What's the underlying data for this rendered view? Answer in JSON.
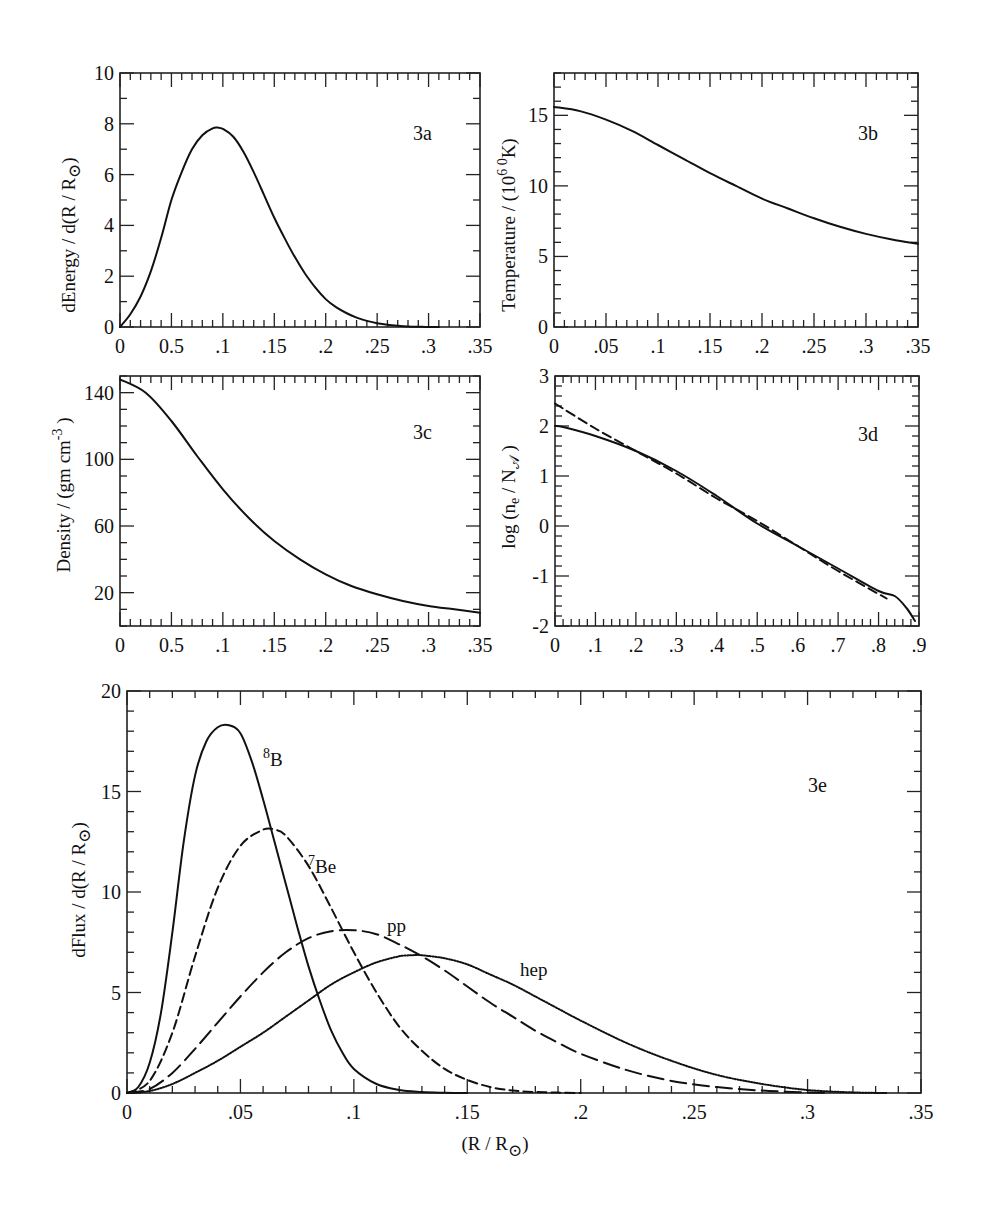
{
  "chart_data": [
    {
      "id": "3a",
      "type": "line",
      "panel_tag": "3a",
      "title": "",
      "xlabel": "",
      "ylabel": "dEnergy / d(R / R⊙)",
      "xlim": [
        0,
        0.35
      ],
      "ylim": [
        0,
        10
      ],
      "x_tick_labels": [
        "0",
        "0.5",
        ".1",
        ".15",
        ".2",
        ".25",
        ".3",
        ".35"
      ],
      "y_tick_labels": [
        "0",
        "2",
        "4",
        "6",
        "8",
        "10"
      ],
      "series": [
        {
          "name": "energy generation",
          "style": "solid",
          "x": [
            0,
            0.01,
            0.02,
            0.03,
            0.04,
            0.05,
            0.06,
            0.07,
            0.08,
            0.09,
            0.095,
            0.1,
            0.11,
            0.12,
            0.13,
            0.14,
            0.15,
            0.16,
            0.17,
            0.18,
            0.19,
            0.2,
            0.21,
            0.22,
            0.23,
            0.24,
            0.25,
            0.26,
            0.27,
            0.28,
            0.29,
            0.3,
            0.31
          ],
          "y": [
            0,
            0.5,
            1.2,
            2.2,
            3.5,
            5.0,
            6.1,
            7.0,
            7.55,
            7.82,
            7.85,
            7.8,
            7.5,
            6.9,
            6.1,
            5.2,
            4.3,
            3.5,
            2.75,
            2.1,
            1.55,
            1.1,
            0.78,
            0.55,
            0.37,
            0.24,
            0.15,
            0.09,
            0.05,
            0.02,
            0.01,
            0.0,
            0.0
          ]
        }
      ],
      "grid": false
    },
    {
      "id": "3b",
      "type": "line",
      "panel_tag": "3b",
      "title": "",
      "xlabel": "",
      "ylabel": "Temperature / (10⁶ ⁰K)",
      "xlim": [
        0,
        0.35
      ],
      "ylim": [
        0,
        18
      ],
      "x_tick_labels": [
        "0",
        ".05",
        ".1",
        ".15",
        ".2",
        ".25",
        ".3",
        ".35"
      ],
      "y_tick_labels": [
        "0",
        "5",
        "10",
        "15"
      ],
      "series": [
        {
          "name": "temperature",
          "style": "solid",
          "x": [
            0,
            0.025,
            0.05,
            0.075,
            0.1,
            0.125,
            0.15,
            0.175,
            0.2,
            0.225,
            0.25,
            0.275,
            0.3,
            0.325,
            0.35
          ],
          "y": [
            15.6,
            15.3,
            14.7,
            13.9,
            12.9,
            11.9,
            10.9,
            10.0,
            9.1,
            8.4,
            7.7,
            7.1,
            6.6,
            6.2,
            5.9
          ]
        }
      ],
      "grid": false
    },
    {
      "id": "3c",
      "type": "line",
      "panel_tag": "3c",
      "title": "",
      "xlabel": "",
      "ylabel": "Density / (gm cm⁻³ )",
      "xlim": [
        0,
        0.35
      ],
      "ylim": [
        0,
        150
      ],
      "x_tick_labels": [
        "0",
        "0.5",
        ".1",
        ".15",
        ".2",
        ".25",
        ".3",
        ".35"
      ],
      "y_tick_labels": [
        "20",
        "60",
        "100",
        "140"
      ],
      "series": [
        {
          "name": "density",
          "style": "solid",
          "x": [
            0,
            0.025,
            0.05,
            0.075,
            0.1,
            0.125,
            0.15,
            0.175,
            0.2,
            0.225,
            0.25,
            0.275,
            0.3,
            0.325,
            0.35
          ],
          "y": [
            148,
            140,
            123,
            102,
            82,
            65,
            51,
            40,
            31,
            24,
            19,
            15,
            12,
            10,
            8
          ]
        }
      ],
      "grid": false
    },
    {
      "id": "3d",
      "type": "line",
      "panel_tag": "3d",
      "title": "",
      "xlabel": "",
      "ylabel": "log (nₑ / N𝒜 )",
      "xlim": [
        0,
        0.9
      ],
      "ylim": [
        -2,
        3
      ],
      "x_tick_labels": [
        "0",
        ".1",
        ".2",
        ".3",
        ".4",
        ".5",
        ".6",
        ".7",
        ".8",
        ".9"
      ],
      "y_tick_labels": [
        "-2",
        "-1",
        "0",
        "1",
        "2",
        "3"
      ],
      "series": [
        {
          "name": "solar model",
          "style": "solid",
          "x": [
            0,
            0.02,
            0.1,
            0.2,
            0.3,
            0.4,
            0.5,
            0.6,
            0.7,
            0.8,
            0.84,
            0.87,
            0.89
          ],
          "y": [
            2.0,
            1.98,
            1.8,
            1.5,
            1.1,
            0.6,
            0.05,
            -0.4,
            -0.85,
            -1.3,
            -1.4,
            -1.65,
            -1.9
          ]
        },
        {
          "name": "exponential approximation",
          "style": "dashed",
          "x": [
            0,
            0.1,
            0.2,
            0.3,
            0.4,
            0.5,
            0.6,
            0.7,
            0.82
          ],
          "y": [
            2.45,
            1.95,
            1.5,
            1.05,
            0.55,
            0.1,
            -0.4,
            -0.9,
            -1.45
          ]
        }
      ],
      "grid": false
    },
    {
      "id": "3e",
      "type": "line",
      "panel_tag": "3e",
      "title": "",
      "xlabel": "(R / R⊙)",
      "ylabel": "dFlux / d(R / R⊙)",
      "xlim": [
        0,
        0.35
      ],
      "ylim": [
        0,
        20
      ],
      "x_tick_labels": [
        "0",
        ".05",
        ".1",
        ".15",
        ".2",
        ".25",
        ".3",
        ".35"
      ],
      "y_tick_labels": [
        "0",
        "5",
        "10",
        "15",
        "20"
      ],
      "series": [
        {
          "name": "8B",
          "label": "⁸B",
          "style": "solid",
          "x": [
            0,
            0.005,
            0.01,
            0.015,
            0.02,
            0.025,
            0.03,
            0.035,
            0.04,
            0.045,
            0.05,
            0.055,
            0.06,
            0.065,
            0.07,
            0.075,
            0.08,
            0.085,
            0.09,
            0.095,
            0.1,
            0.11,
            0.12,
            0.13,
            0.14,
            0.15
          ],
          "y": [
            0,
            0.3,
            1.5,
            4.0,
            8.0,
            12.5,
            15.8,
            17.5,
            18.2,
            18.3,
            17.9,
            16.5,
            14.6,
            12.5,
            10.4,
            8.3,
            6.3,
            4.6,
            3.1,
            2.0,
            1.2,
            0.45,
            0.15,
            0.05,
            0.01,
            0.0
          ]
        },
        {
          "name": "7Be",
          "label": "⁷Be",
          "style": "short-dashed",
          "x": [
            0,
            0.01,
            0.02,
            0.03,
            0.04,
            0.05,
            0.06,
            0.065,
            0.07,
            0.08,
            0.09,
            0.1,
            0.11,
            0.12,
            0.13,
            0.14,
            0.15,
            0.16,
            0.17,
            0.18,
            0.19,
            0.2
          ],
          "y": [
            0,
            0.6,
            3.0,
            6.8,
            10.2,
            12.3,
            13.1,
            13.1,
            12.8,
            11.3,
            9.2,
            7.0,
            5.0,
            3.3,
            2.1,
            1.2,
            0.65,
            0.3,
            0.12,
            0.05,
            0.02,
            0.0
          ]
        },
        {
          "name": "pp",
          "label": "pp",
          "style": "long-dashed",
          "x": [
            0,
            0.01,
            0.02,
            0.03,
            0.04,
            0.05,
            0.06,
            0.07,
            0.08,
            0.09,
            0.1,
            0.11,
            0.12,
            0.13,
            0.14,
            0.15,
            0.16,
            0.17,
            0.18,
            0.19,
            0.2,
            0.22,
            0.24,
            0.26,
            0.28,
            0.3,
            0.31
          ],
          "y": [
            0,
            0.2,
            1.0,
            2.2,
            3.5,
            4.8,
            6.0,
            7.0,
            7.7,
            8.05,
            8.1,
            7.9,
            7.4,
            6.8,
            6.1,
            5.3,
            4.5,
            3.8,
            3.1,
            2.5,
            1.95,
            1.15,
            0.6,
            0.3,
            0.12,
            0.03,
            0.0
          ]
        },
        {
          "name": "hep",
          "label": "hep",
          "style": "dotted",
          "x": [
            0,
            0.01,
            0.02,
            0.03,
            0.04,
            0.05,
            0.06,
            0.07,
            0.08,
            0.09,
            0.1,
            0.11,
            0.12,
            0.125,
            0.13,
            0.14,
            0.15,
            0.16,
            0.17,
            0.18,
            0.19,
            0.2,
            0.22,
            0.24,
            0.26,
            0.28,
            0.3,
            0.32,
            0.335
          ],
          "y": [
            0,
            0.1,
            0.45,
            1.0,
            1.6,
            2.3,
            3.0,
            3.8,
            4.6,
            5.4,
            6.0,
            6.5,
            6.8,
            6.85,
            6.85,
            6.7,
            6.4,
            5.9,
            5.4,
            4.8,
            4.2,
            3.6,
            2.5,
            1.6,
            0.9,
            0.45,
            0.15,
            0.03,
            0.0
          ]
        }
      ],
      "annotations": [
        "⁸B",
        "⁷Be",
        "pp",
        "hep",
        "3e"
      ],
      "grid": false
    }
  ],
  "panels": {
    "a": {
      "tag": "3a",
      "ylabel": "dEnergy / d(R / R",
      "ylabel_sub": "⊙",
      "ylabel_close": ")"
    },
    "b": {
      "tag": "3b",
      "ylabel": "Temperature / (10",
      "ylabel_sup1": "6",
      "ylabel_sup2": "0",
      "ylabel_close": "K)"
    },
    "c": {
      "tag": "3c",
      "ylabel": "Density / (gm  cm",
      "ylabel_sup": "-3",
      "ylabel_close": " )"
    },
    "d": {
      "tag": "3d",
      "ylabel": "log (n",
      "ylabel_sub1": "e",
      "ylabel_mid": " / N",
      "ylabel_sub2": "𝒜",
      "ylabel_close": " )"
    },
    "e": {
      "tag": "3e",
      "ylabel": "dFlux / d(R / R",
      "ylabel_sub": "⊙",
      "ylabel_close": ")",
      "xlabel": "(R / R",
      "xlabel_sub": "⊙",
      "xlabel_close": ")",
      "labels": {
        "b8_sup": "8",
        "b8": "B",
        "be7_sup": "7",
        "be7": "Be",
        "pp": "pp",
        "hep": "hep"
      }
    }
  }
}
